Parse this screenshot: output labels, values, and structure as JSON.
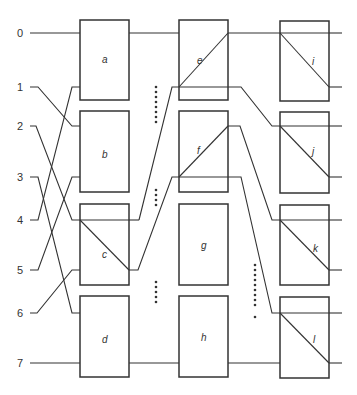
{
  "diagram": {
    "type": "sorting/switching network",
    "colors": {
      "line": "#333333",
      "background": "#ffffff"
    },
    "rows": [
      {
        "label": "0",
        "y": 33
      },
      {
        "label": "1",
        "y": 87
      },
      {
        "label": "2",
        "y": 126
      },
      {
        "label": "3",
        "y": 177
      },
      {
        "label": "4",
        "y": 220
      },
      {
        "label": "5",
        "y": 270
      },
      {
        "label": "6",
        "y": 313
      },
      {
        "label": "7",
        "y": 363
      }
    ],
    "boxes": [
      {
        "id": "a",
        "label": "a",
        "col": 1,
        "diagonal": "none"
      },
      {
        "id": "b",
        "label": "b",
        "col": 1,
        "diagonal": "none"
      },
      {
        "id": "c",
        "label": "c",
        "col": 1,
        "diagonal": "down"
      },
      {
        "id": "d",
        "label": "d",
        "col": 1,
        "diagonal": "none"
      },
      {
        "id": "e",
        "label": "e",
        "col": 2,
        "diagonal": "up"
      },
      {
        "id": "f",
        "label": "f",
        "col": 2,
        "diagonal": "up"
      },
      {
        "id": "g",
        "label": "g",
        "col": 2,
        "diagonal": "none"
      },
      {
        "id": "h",
        "label": "h",
        "col": 2,
        "diagonal": "none"
      },
      {
        "id": "i",
        "label": "i",
        "col": 3,
        "diagonal": "down"
      },
      {
        "id": "j",
        "label": "j",
        "col": 3,
        "diagonal": "down"
      },
      {
        "id": "k",
        "label": "k",
        "col": 3,
        "diagonal": "down"
      },
      {
        "id": "l",
        "label": "l",
        "col": 3,
        "diagonal": "down"
      }
    ],
    "ellipses": [
      {
        "between": "col1-col2",
        "near": "a/b",
        "dots": 8
      },
      {
        "between": "col1-col2",
        "near": "b/c",
        "dots": 4
      },
      {
        "between": "col1-col2",
        "near": "c/d",
        "dots": 5
      },
      {
        "between": "col2-col3",
        "near": "k/l",
        "dots": 10
      }
    ]
  }
}
